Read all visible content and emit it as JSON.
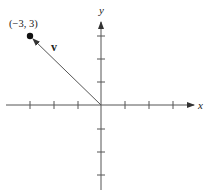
{
  "diagram": {
    "type": "vector-on-coordinate-plane",
    "axes": {
      "x_label": "x",
      "y_label": "y",
      "tick_step": 1,
      "x_range": [
        -3,
        3
      ],
      "y_range": [
        -3,
        3
      ]
    },
    "vector": {
      "label": "v",
      "tail": [
        0,
        0
      ],
      "head": [
        -3,
        3
      ]
    },
    "point": {
      "label": "(−3, 3)",
      "coords": [
        -3,
        3
      ]
    },
    "colors": {
      "line": "#555555",
      "text": "#222222",
      "background": "#ffffff"
    }
  }
}
